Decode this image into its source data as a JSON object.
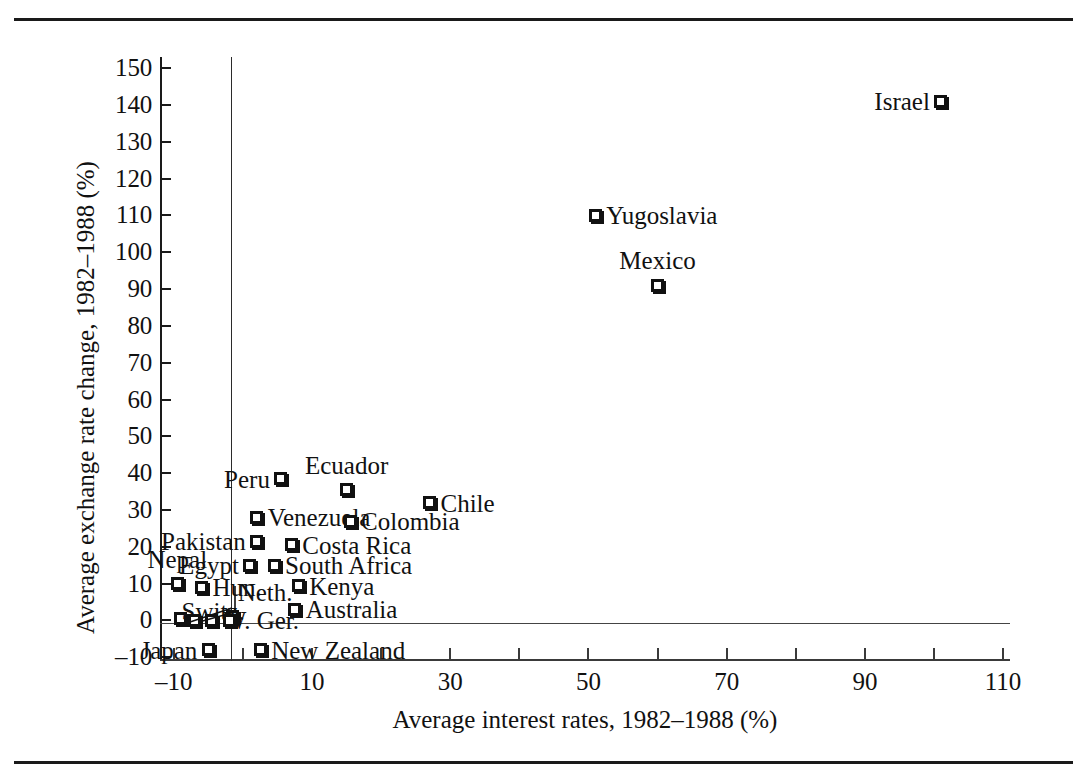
{
  "figure": {
    "has_top_rule": true,
    "has_bottom_rule": true,
    "background": "#ffffff",
    "ink": "#111111"
  },
  "chart_data": {
    "type": "scatter",
    "title": "",
    "xlabel": "Average interest rates, 1982–1988 (%)",
    "ylabel": "Average exchange rate change, 1982–1988 (%)",
    "xlim": [
      -12,
      111
    ],
    "ylim": [
      -11,
      153
    ],
    "xticks": [
      -10,
      10,
      30,
      50,
      70,
      90,
      110
    ],
    "xticklabels": [
      "–10",
      "10",
      "30",
      "50",
      "70",
      "90",
      "110"
    ],
    "xminor_ticks": [
      0,
      20,
      40,
      60,
      80,
      100
    ],
    "yticks": [
      -10,
      0,
      10,
      20,
      30,
      40,
      50,
      60,
      70,
      80,
      90,
      100,
      110,
      120,
      130,
      140,
      150
    ],
    "yticklabels": [
      "–10",
      "0",
      "10",
      "20",
      "30",
      "40",
      "50",
      "60",
      "70",
      "80",
      "90",
      "100",
      "110",
      "120",
      "130",
      "140",
      "150"
    ],
    "grid": false,
    "legend": "none",
    "reference_lines": [
      {
        "orientation": "vertical",
        "value": 0
      },
      {
        "orientation": "horizontal",
        "value": 0
      }
    ],
    "marker_style": "open-square-with-shadow",
    "points": [
      {
        "name": "Israel",
        "x": 101.0,
        "y": 141.0,
        "label": "Israel",
        "label_pos": "left"
      },
      {
        "name": "Yugoslavia",
        "x": 51.0,
        "y": 110.0,
        "label": "Yugoslavia",
        "label_pos": "right"
      },
      {
        "name": "Mexico",
        "x": 60.0,
        "y": 91.0,
        "label": "Mexico",
        "label_pos": "above"
      },
      {
        "name": "Ecuador",
        "x": 15.0,
        "y": 35.5,
        "label": "Ecuador",
        "label_pos": "above"
      },
      {
        "name": "Peru",
        "x": 5.5,
        "y": 38.5,
        "label": "Peru",
        "label_pos": "left"
      },
      {
        "name": "Chile",
        "x": 27.0,
        "y": 32.0,
        "label": "Chile",
        "label_pos": "right"
      },
      {
        "name": "Venezuela",
        "x": 2.0,
        "y": 28.0,
        "label": "Venezuela",
        "label_pos": "right"
      },
      {
        "name": "Colombia",
        "x": 15.5,
        "y": 27.0,
        "label": "Colombia",
        "label_pos": "right"
      },
      {
        "name": "Pakistan",
        "x": 2.0,
        "y": 21.5,
        "label": "Pakistan",
        "label_pos": "left"
      },
      {
        "name": "Costa Rica",
        "x": 7.0,
        "y": 20.5,
        "label": "Costa Rica",
        "label_pos": "right"
      },
      {
        "name": "Egypt",
        "x": 1.0,
        "y": 15.0,
        "label": "Egypt",
        "label_pos": "left"
      },
      {
        "name": "South Africa",
        "x": 4.5,
        "y": 15.0,
        "label": "South Africa",
        "label_pos": "right"
      },
      {
        "name": "Nepal",
        "x": -9.5,
        "y": 10.0,
        "label": "Nepal",
        "label_pos": "above"
      },
      {
        "name": "Hungary",
        "x": -6.0,
        "y": 9.0,
        "label": "Hun.",
        "label_pos": "right"
      },
      {
        "name": "Netherlands",
        "x": -1.5,
        "y": 1.0,
        "label": "Neth.",
        "label_pos": "leader"
      },
      {
        "name": "Kenya",
        "x": 8.0,
        "y": 9.5,
        "label": "Kenya",
        "label_pos": "right"
      },
      {
        "name": "Switzerland",
        "x": -9.0,
        "y": 0.5,
        "label": "Switz.",
        "label_pos": "leader"
      },
      {
        "name": "Australia",
        "x": 7.5,
        "y": 3.0,
        "label": "Australia",
        "label_pos": "right"
      },
      {
        "name": "West Germany",
        "x": -7.0,
        "y": 0.0,
        "label": "",
        "label_pos": "none"
      },
      {
        "name": "Unnamed-A",
        "x": -4.5,
        "y": 0.0,
        "label": "W. Ger.",
        "label_pos": "right"
      },
      {
        "name": "Unnamed-B",
        "x": -2.0,
        "y": 0.0,
        "label": "",
        "label_pos": "none"
      },
      {
        "name": "Japan",
        "x": -5.0,
        "y": -8.0,
        "label": "Japan",
        "label_pos": "left"
      },
      {
        "name": "New Zealand",
        "x": 2.5,
        "y": -8.0,
        "label": "New Zealand",
        "label_pos": "right"
      }
    ]
  }
}
